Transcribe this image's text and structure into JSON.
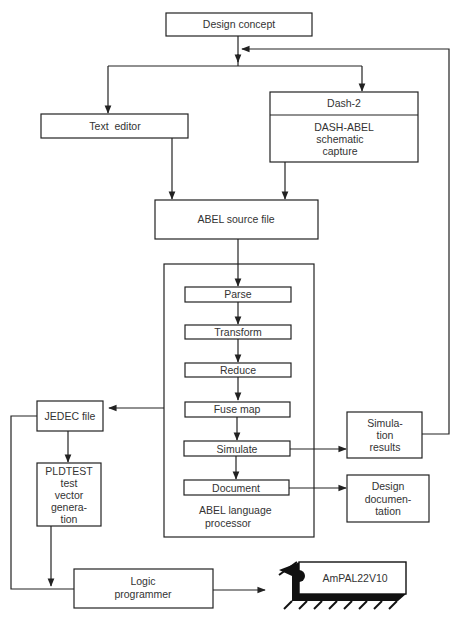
{
  "diagram": {
    "type": "flowchart",
    "colors": {
      "line": "#222222",
      "text": "#333333",
      "background": "#ffffff"
    },
    "nodes": {
      "design_concept": {
        "label": "Design concept"
      },
      "text_editor": {
        "label": "Text  editor"
      },
      "dash2": {
        "header": "Dash-2",
        "lines": [
          "DASH-ABEL",
          "schematic",
          "capture"
        ]
      },
      "abel_source": {
        "label": "ABEL source file"
      },
      "processor": {
        "title_lines": [
          "ABEL language",
          "processor"
        ],
        "steps": [
          "Parse",
          "Transform",
          "Reduce",
          "Fuse map",
          "Simulate",
          "Document"
        ]
      },
      "jedec": {
        "label": "JEDEC file"
      },
      "pldtest": {
        "lines": [
          "PLDTEST",
          "test",
          "vector",
          "genera-",
          "tion"
        ]
      },
      "sim_results": {
        "lines": [
          "Simula-",
          "tion",
          "results"
        ]
      },
      "design_doc": {
        "lines": [
          "Design",
          "documen-",
          "tation"
        ]
      },
      "logic_programmer": {
        "lines": [
          "Logic",
          "programmer"
        ]
      },
      "chip": {
        "label": "AmPAL22V10",
        "icon": "ic-chip-icon"
      }
    },
    "edges": [
      [
        "Design concept",
        "Text editor"
      ],
      [
        "Design concept",
        "Dash-2"
      ],
      [
        "Text editor",
        "ABEL source file"
      ],
      [
        "Dash-2",
        "ABEL source file"
      ],
      [
        "ABEL source file",
        "Parse"
      ],
      [
        "Parse",
        "Transform"
      ],
      [
        "Transform",
        "Reduce"
      ],
      [
        "Reduce",
        "Fuse map"
      ],
      [
        "Fuse map",
        "Simulate"
      ],
      [
        "Simulate",
        "Document"
      ],
      [
        "ABEL language processor",
        "JEDEC file"
      ],
      [
        "Simulate",
        "Simulation results"
      ],
      [
        "Simulation results",
        "Design concept (feedback)"
      ],
      [
        "Document",
        "Design documentation"
      ],
      [
        "JEDEC file",
        "PLDTEST test vector generation"
      ],
      [
        "JEDEC file",
        "Logic programmer"
      ],
      [
        "PLDTEST test vector generation",
        "Logic programmer"
      ],
      [
        "Logic programmer",
        "AmPAL22V10"
      ]
    ]
  }
}
